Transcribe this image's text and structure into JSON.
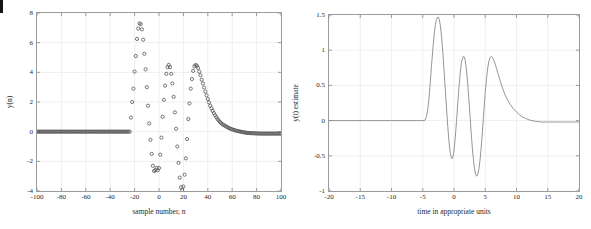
{
  "page": {
    "background": "#ffffff",
    "axis_color": "#9b9b9b",
    "grid_color": "#efefef",
    "marker_color": "#555555",
    "line_color": "#8a8a8a",
    "text_color": "#1f1f1f",
    "edge_mark_color": "#151515"
  },
  "chart_data": [
    {
      "id": "left-plot",
      "type": "scatter",
      "title": "",
      "xlabel": "sample number, n",
      "ylabel": "y(n)",
      "xlim": [
        -100,
        100
      ],
      "ylim": [
        -4,
        8
      ],
      "xticks": [
        -100,
        -80,
        -60,
        -40,
        -20,
        0,
        20,
        40,
        60,
        80,
        100
      ],
      "xticklabels": [
        "-100",
        "-80",
        "-60",
        "-40",
        "-20",
        "0",
        "20",
        "40",
        "60",
        "80",
        "100"
      ],
      "yticks": [
        -4,
        -2,
        0,
        2,
        4,
        6,
        8
      ],
      "yticklabels": [
        "-4",
        "-2",
        "0",
        "2",
        "4",
        "6",
        "8"
      ],
      "grid": true,
      "legend": null,
      "marker": "o",
      "marker_size": 1.6,
      "description": "Densely sampled circle markers: zero for n < -24, a large rapidly oscillating transient between n = -24 and n = +24 whose envelope peaks near 7.3, then a smooth decaying hump peaking at about 4.5 near n = 30 settling back toward 0 by n = 80.",
      "series": [
        {
          "name": "y(n)",
          "x": [
            -100,
            -96,
            -92,
            -88,
            -84,
            -80,
            -76,
            -72,
            -68,
            -64,
            -60,
            -56,
            -52,
            -48,
            -44,
            -40,
            -36,
            -32,
            -28,
            -26,
            -24,
            -23,
            -22,
            -21,
            -20,
            -19,
            -18,
            -17,
            -16,
            -15,
            -14,
            -13,
            -12,
            -11,
            -10,
            -9,
            -8,
            -7,
            -6,
            -5,
            -4,
            -3,
            -2,
            -1,
            0,
            1,
            2,
            3,
            4,
            5,
            6,
            7,
            8,
            9,
            10,
            11,
            12,
            13,
            14,
            15,
            16,
            17,
            18,
            19,
            20,
            21,
            22,
            23,
            24,
            25,
            26,
            27,
            28,
            29,
            30,
            31,
            32,
            33,
            34,
            35,
            36,
            38,
            40,
            42,
            44,
            46,
            48,
            50,
            52,
            54,
            56,
            58,
            60,
            64,
            68,
            72,
            76,
            80,
            84,
            88,
            92,
            96,
            100
          ],
          "y": [
            0,
            0,
            0,
            0,
            0,
            0,
            0,
            0,
            0,
            0,
            0,
            0,
            0,
            0,
            0,
            0,
            0,
            0,
            0,
            0,
            0,
            0.95,
            2.0,
            2.9,
            4.05,
            5.1,
            6.25,
            6.95,
            7.3,
            7.25,
            6.9,
            6.2,
            5.25,
            4.2,
            3.0,
            1.75,
            0.55,
            -0.55,
            -1.5,
            -2.3,
            -2.65,
            -2.6,
            -2.45,
            -2.6,
            -2.45,
            -1.55,
            -0.4,
            1.0,
            2.15,
            3.1,
            3.9,
            4.35,
            4.5,
            4.35,
            3.9,
            3.25,
            2.35,
            1.3,
            0.2,
            -1.0,
            -2.1,
            -3.1,
            -3.75,
            -3.95,
            -3.7,
            -2.9,
            -1.8,
            -0.5,
            0.85,
            1.9,
            2.9,
            3.55,
            4.1,
            4.4,
            4.5,
            4.45,
            4.3,
            4.05,
            3.8,
            3.5,
            3.25,
            2.7,
            2.2,
            1.75,
            1.4,
            1.1,
            0.85,
            0.65,
            0.5,
            0.4,
            0.3,
            0.22,
            0.15,
            0.05,
            -0.02,
            -0.08,
            -0.1,
            -0.12,
            -0.13,
            -0.13,
            -0.13,
            -0.13,
            -0.13
          ]
        }
      ]
    },
    {
      "id": "right-plot",
      "type": "line",
      "title": "",
      "xlabel": "time in appropriate units",
      "ylabel": "y(t) estimate",
      "xlim": [
        -20,
        20
      ],
      "ylim": [
        -1,
        1.5
      ],
      "xticks": [
        -20,
        -15,
        -10,
        -5,
        0,
        5,
        10,
        15,
        20
      ],
      "xticklabels": [
        "-20",
        "-15",
        "-10",
        "-5",
        "0",
        "5",
        "10",
        "15",
        "20"
      ],
      "yticks": [
        -1,
        -0.5,
        0,
        0.5,
        1,
        1.5
      ],
      "yticklabels": [
        "-1",
        "-0.5",
        "0",
        "0.5",
        "1",
        "1.5"
      ],
      "grid": true,
      "legend": null,
      "description": "Smooth continuous curve: identically zero until t = -4.7, a sharp main lobe peaking at 1.47 near t = -2.5, a negative lobe of -0.55 near t = -0.4, a lobe of 0.91 near t = 1.6, a negative lobe of -0.79 near t = 3.6, a final lobe of 0.91 near t = 6.0, then a long monotone decay to about -0.02 by t = 17 and flat to t = 20.",
      "series": [
        {
          "name": "y(t) estimate",
          "x": [
            -20,
            -18,
            -16,
            -14,
            -12,
            -10,
            -8,
            -6,
            -5.2,
            -4.8,
            -4.6,
            -4.4,
            -4.2,
            -4.0,
            -3.8,
            -3.6,
            -3.4,
            -3.2,
            -3.0,
            -2.8,
            -2.6,
            -2.5,
            -2.4,
            -2.2,
            -2.0,
            -1.8,
            -1.6,
            -1.4,
            -1.2,
            -1.0,
            -0.8,
            -0.6,
            -0.4,
            -0.2,
            0,
            0.2,
            0.4,
            0.6,
            0.8,
            1.0,
            1.2,
            1.4,
            1.6,
            1.8,
            2.0,
            2.2,
            2.4,
            2.6,
            2.8,
            3.0,
            3.2,
            3.4,
            3.6,
            3.8,
            4.0,
            4.2,
            4.4,
            4.6,
            4.8,
            5.0,
            5.2,
            5.4,
            5.6,
            5.8,
            6.0,
            6.2,
            6.4,
            6.6,
            6.8,
            7.0,
            7.4,
            7.8,
            8.2,
            8.6,
            9.0,
            9.5,
            10.0,
            10.5,
            11.0,
            11.5,
            12.0,
            13.0,
            14.0,
            15.0,
            16.0,
            17.0,
            18.0,
            19.0,
            20.0
          ],
          "y": [
            0,
            0,
            0,
            0,
            0,
            0,
            0,
            0,
            0,
            0,
            0.01,
            0.06,
            0.16,
            0.32,
            0.54,
            0.78,
            1.0,
            1.2,
            1.35,
            1.44,
            1.47,
            1.47,
            1.45,
            1.36,
            1.2,
            0.98,
            0.72,
            0.45,
            0.18,
            -0.08,
            -0.3,
            -0.46,
            -0.54,
            -0.53,
            -0.42,
            -0.24,
            -0.01,
            0.24,
            0.48,
            0.68,
            0.83,
            0.9,
            0.91,
            0.86,
            0.72,
            0.52,
            0.28,
            0.02,
            -0.24,
            -0.46,
            -0.63,
            -0.74,
            -0.79,
            -0.77,
            -0.68,
            -0.53,
            -0.33,
            -0.09,
            0.16,
            0.4,
            0.6,
            0.75,
            0.85,
            0.9,
            0.91,
            0.89,
            0.85,
            0.8,
            0.74,
            0.68,
            0.56,
            0.45,
            0.36,
            0.29,
            0.23,
            0.17,
            0.12,
            0.08,
            0.05,
            0.03,
            0.01,
            -0.01,
            -0.02,
            -0.02,
            -0.02,
            -0.02,
            -0.02,
            -0.02,
            -0.02
          ]
        }
      ]
    }
  ]
}
